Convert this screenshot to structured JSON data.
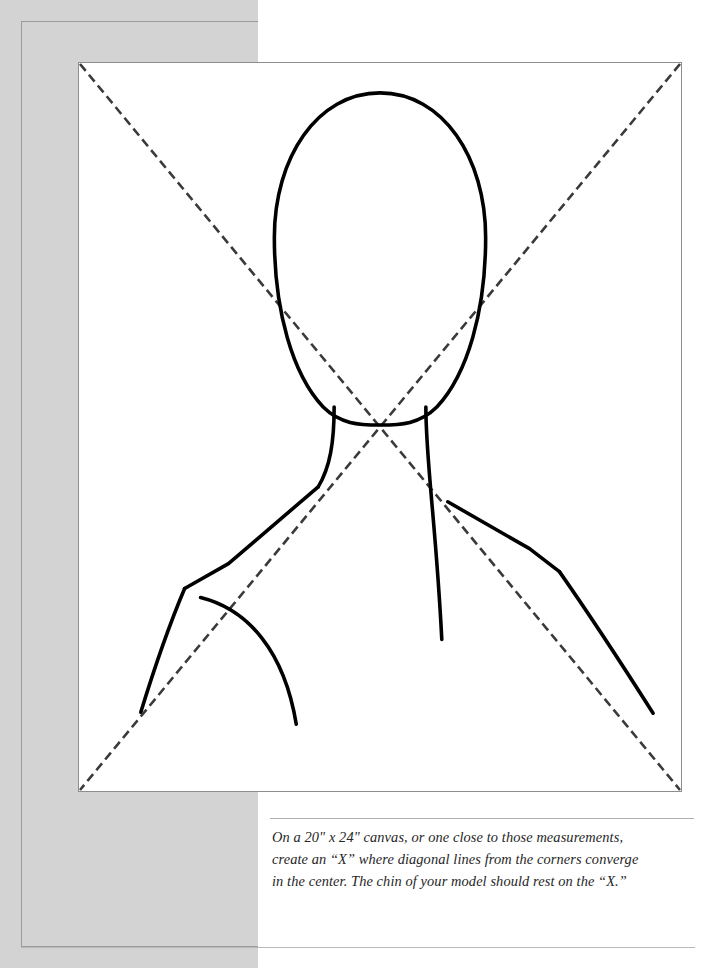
{
  "page": {
    "background_color": "#ffffff"
  },
  "decor": {
    "gray_panel": {
      "name": "gray-side-panel",
      "color": "#d3d3d3",
      "rule_color": "#9b9b9b"
    },
    "baseline_rule_color": "#b9b9b9",
    "caption_rule_color": "#b0b0b0"
  },
  "illustration": {
    "name": "head-and-shoulders-diagram",
    "card_border_color": "#8d8d8d",
    "card_background": "#ffffff",
    "ink_color": "#000000",
    "guide_color": "#3a3a3a",
    "guides": {
      "label": "diagonal corner-to-corner construction lines forming an X",
      "dash_pattern": "9 5",
      "stroke_width": 2.6,
      "convergence_point": "center of canvas, at the chin"
    },
    "figure_parts": [
      "head-oval",
      "neck-left",
      "neck-right",
      "shoulder-left",
      "shoulder-right",
      "arm-left",
      "arm-right",
      "chest-curve"
    ]
  },
  "caption": {
    "name": "instruction-caption",
    "lines": [
      "On a 20\" x 24\" canvas, or one close to those measurements,",
      "create an “X” where diagonal lines from the corners converge",
      "in the center. The chin of your model should rest on the “X.”"
    ],
    "full_text": "On a 20\" x 24\" canvas, or one close to those measurements, create an “X” where diagonal lines from the corners converge in the center. The chin of your model should rest on the “X.”"
  }
}
